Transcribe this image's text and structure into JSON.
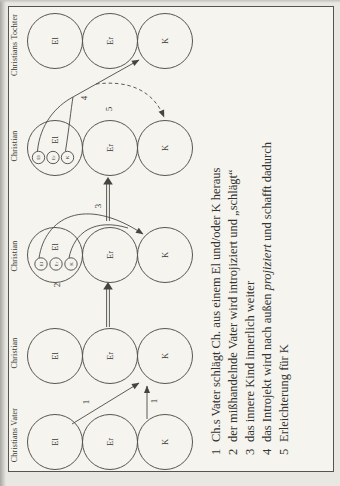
{
  "figure": {
    "type": "transactional-analysis-ego-state-diagram",
    "columns": [
      {
        "header": "Christians Vater",
        "ego_states": [
          "El",
          "Er",
          "K"
        ]
      },
      {
        "header": "Christian",
        "ego_states": [
          "El",
          "Er",
          "K"
        ]
      },
      {
        "header": "Christian",
        "ego_states": [
          "El",
          "Er",
          "K"
        ],
        "introject": [
          "El",
          "Er",
          "K"
        ]
      },
      {
        "header": "Christian",
        "ego_states": [
          "El",
          "Er",
          "K"
        ],
        "introject": [
          "El",
          "Er",
          "K"
        ]
      },
      {
        "header": "Christians Tochter",
        "ego_states": [
          "El",
          "Er",
          "K"
        ]
      }
    ],
    "step_labels": {
      "one_a": "1",
      "one_b": "1",
      "two": "2",
      "three": "3",
      "four": "4",
      "five": "5"
    },
    "legend": [
      {
        "num": "1",
        "pre": "Ch.s Vater schlägt Ch. aus einem El und/oder K heraus",
        "italic": "",
        "post": ""
      },
      {
        "num": "2",
        "pre": "der mißhandelnde Vater wird introjiziert und „schlägt“",
        "italic": "",
        "post": ""
      },
      {
        "num": "3",
        "pre": "das innere Kind innerlich weiter",
        "italic": "",
        "post": ""
      },
      {
        "num": "4",
        "pre": "das Introjekt wird nach außen ",
        "italic": "projiziert",
        "post": " und schafft dadurch"
      },
      {
        "num": "5",
        "pre": "Erleichterung für K",
        "italic": "",
        "post": ""
      }
    ],
    "colors": {
      "ink": "#45443f",
      "paper": "#f5f4ef",
      "page": "#e9e7e2"
    }
  }
}
